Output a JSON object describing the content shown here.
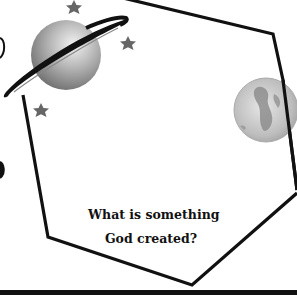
{
  "card": {
    "question_line1": "What is something",
    "question_line2": "God created?",
    "frame_shape": "hexagon",
    "stroke_color": "#111111",
    "background_color": "#ffffff"
  },
  "illustrations": [
    {
      "name": "planet-saturn-icon",
      "color": "#9a9a9a"
    },
    {
      "name": "globe-earth-icon",
      "color": "#bdbdbd"
    },
    {
      "name": "star-icon",
      "count": 3,
      "color": "#666666"
    }
  ]
}
